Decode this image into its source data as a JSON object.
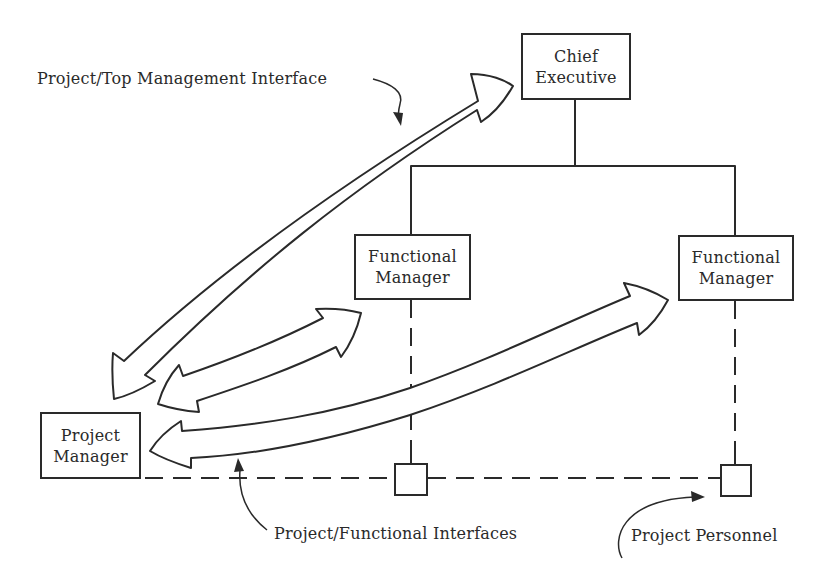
{
  "diagram": {
    "nodes": {
      "chief_executive": {
        "line1": "Chief",
        "line2": "Executive"
      },
      "functional_manager_left": {
        "line1": "Functional",
        "line2": "Manager"
      },
      "functional_manager_right": {
        "line1": "Functional",
        "line2": "Manager"
      },
      "project_manager": {
        "line1": "Project",
        "line2": "Manager"
      },
      "project_personnel_left": {
        "label": ""
      },
      "project_personnel_right": {
        "label": ""
      }
    },
    "labels": {
      "top_interface": "Project/Top Management Interface",
      "functional_interfaces": "Project/Functional Interfaces",
      "project_personnel": "Project Personnel"
    },
    "edges": [
      {
        "from": "chief_executive",
        "to": "functional_manager_left",
        "style": "solid"
      },
      {
        "from": "chief_executive",
        "to": "functional_manager_right",
        "style": "solid"
      },
      {
        "from": "functional_manager_left",
        "to": "project_personnel_left",
        "style": "dashed"
      },
      {
        "from": "functional_manager_right",
        "to": "project_personnel_right",
        "style": "dashed"
      },
      {
        "from": "project_manager",
        "to": "project_personnel_left",
        "style": "dashed"
      },
      {
        "from": "project_personnel_left",
        "to": "project_personnel_right",
        "style": "dashed"
      }
    ],
    "interfaces": [
      {
        "between": [
          "project_manager",
          "chief_executive"
        ],
        "type": "double-arrow",
        "label": "Project/Top Management Interface"
      },
      {
        "between": [
          "project_manager",
          "functional_manager_left"
        ],
        "type": "double-arrow",
        "label": "Project/Functional Interfaces"
      },
      {
        "between": [
          "project_manager",
          "functional_manager_right"
        ],
        "type": "double-arrow",
        "label": "Project/Functional Interfaces"
      }
    ],
    "colors": {
      "ink": "#2a2a2a",
      "background": "#ffffff"
    }
  }
}
